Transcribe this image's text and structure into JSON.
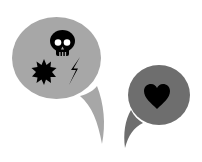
{
  "illustration": {
    "background": "#ffffff",
    "bubbles": [
      {
        "id": "angry-bubble",
        "fill": "#a7a7a7",
        "icons": [
          "skull-icon",
          "splat-icon",
          "lightning-icon"
        ]
      },
      {
        "id": "love-bubble",
        "fill": "#6e6e6e",
        "icons": [
          "heart-icon"
        ]
      }
    ],
    "icon_color": "#000000",
    "skull_eye_color": "#ffffff"
  }
}
